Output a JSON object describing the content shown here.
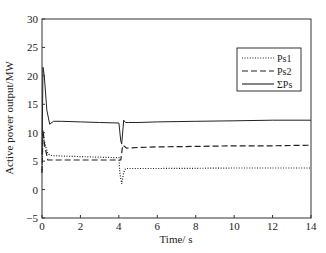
{
  "chart_data": {
    "type": "line",
    "title": "",
    "xlabel": "Time/ s",
    "ylabel": "Active power output/MW",
    "xlim": [
      0,
      14
    ],
    "ylim": [
      -5,
      30
    ],
    "xticks": [
      0,
      2,
      4,
      6,
      8,
      10,
      12,
      14
    ],
    "yticks": [
      -5,
      0,
      5,
      10,
      15,
      20,
      25,
      30
    ],
    "grid": false,
    "legend_position": "upper right",
    "series": [
      {
        "name": "Ps1",
        "style": "dotted",
        "x": [
          0,
          0.05,
          0.15,
          0.3,
          0.5,
          1,
          2,
          3,
          4,
          4.05,
          4.15,
          4.25,
          4.35,
          5,
          6,
          8,
          10,
          12,
          14
        ],
        "y": [
          3,
          10,
          8,
          6.3,
          6.0,
          5.9,
          5.8,
          5.7,
          5.6,
          3,
          1,
          3,
          3.7,
          3.7,
          3.7,
          3.75,
          3.8,
          3.8,
          3.8
        ]
      },
      {
        "name": "Ps2",
        "style": "dashed",
        "x": [
          0,
          0.05,
          0.15,
          0.3,
          0.5,
          1,
          2,
          3,
          4,
          4.1,
          4.2,
          4.3,
          4.4,
          5,
          6,
          8,
          10,
          12,
          14
        ],
        "y": [
          3,
          10.5,
          7.5,
          5.2,
          5.2,
          5.2,
          5.2,
          5.2,
          5.2,
          5.2,
          7.8,
          7.6,
          7.3,
          7.4,
          7.5,
          7.6,
          7.7,
          7.7,
          7.8
        ]
      },
      {
        "name": "ΣPs",
        "style": "solid",
        "x": [
          0,
          0.05,
          0.12,
          0.25,
          0.4,
          0.6,
          1,
          2,
          3,
          4,
          4.1,
          4.15,
          4.25,
          4.35,
          4.5,
          5,
          6,
          8,
          10,
          12,
          14
        ],
        "y": [
          6,
          21.5,
          20,
          14,
          11.5,
          12,
          12,
          11.9,
          11.8,
          11.7,
          8.5,
          8,
          12.2,
          11.8,
          11.8,
          11.8,
          11.9,
          12,
          12.1,
          12.2,
          12.2
        ]
      }
    ]
  }
}
